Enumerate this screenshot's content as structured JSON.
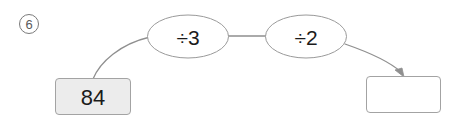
{
  "page": {
    "background_color": "#ffffff",
    "width": 457,
    "height": 122
  },
  "item": {
    "number_label": "6",
    "marker_style": "circled-number",
    "marker_color": "#5a5a5a"
  },
  "diagram": {
    "type": "function-machine",
    "stroke_color": "#9a9a9a",
    "text_color": "#1b1b1b",
    "input_box": {
      "label": "84",
      "fill_color": "#ececec",
      "border_color": "#9a9a9a",
      "filled": true
    },
    "operations": [
      {
        "label": "÷3",
        "shape": "ellipse"
      },
      {
        "label": "÷2",
        "shape": "ellipse"
      }
    ],
    "output_box": {
      "label": "",
      "fill_color": "#ffffff",
      "border_color": "#9a9a9a",
      "filled": false
    },
    "connectors": [
      {
        "from": "input_box",
        "to": "operation-1",
        "style": "curve"
      },
      {
        "from": "operation-1",
        "to": "operation-2",
        "style": "line"
      },
      {
        "from": "operation-2",
        "to": "output_box",
        "style": "curve-arrow"
      }
    ]
  }
}
